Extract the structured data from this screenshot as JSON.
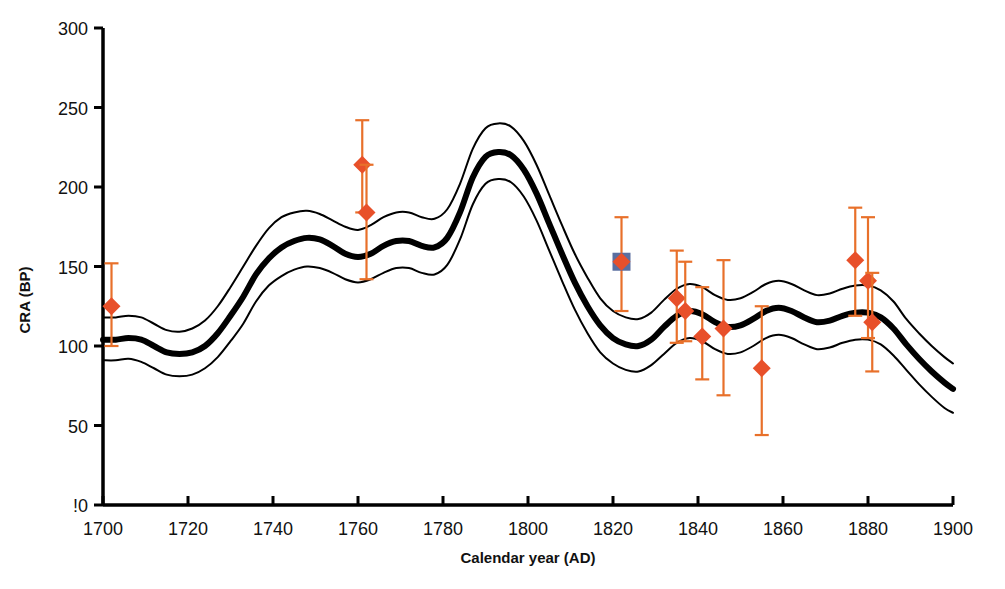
{
  "chart_data": {
    "type": "line",
    "title": "",
    "xlabel": "Calendar year (AD)",
    "ylabel": "CRA (BP)",
    "xlim": [
      1700,
      1900
    ],
    "ylim": [
      0,
      300
    ],
    "xticks": [
      1700,
      1720,
      1740,
      1760,
      1780,
      1800,
      1820,
      1840,
      1860,
      1880,
      1900
    ],
    "yticks": [
      0,
      50,
      100,
      150,
      200,
      250,
      300
    ],
    "ytick_labels": [
      "!0",
      "50",
      "100",
      "150",
      "200",
      "250",
      "300"
    ],
    "grid": false,
    "legend": false,
    "legend_position": "none",
    "series": [
      {
        "name": "calibration-curve-mean",
        "role": "mean",
        "style": "thick-black-line",
        "color": "#000000",
        "width_px": 6,
        "x": [
          1700,
          1703,
          1706,
          1709,
          1712,
          1715,
          1718,
          1721,
          1724,
          1727,
          1730,
          1733,
          1736,
          1739,
          1742,
          1745,
          1748,
          1751,
          1754,
          1757,
          1760,
          1763,
          1766,
          1769,
          1772,
          1775,
          1778,
          1781,
          1784,
          1787,
          1790,
          1793,
          1796,
          1799,
          1802,
          1805,
          1808,
          1811,
          1814,
          1817,
          1820,
          1823,
          1826,
          1829,
          1832,
          1835,
          1838,
          1841,
          1844,
          1847,
          1850,
          1853,
          1856,
          1859,
          1862,
          1865,
          1868,
          1871,
          1874,
          1877,
          1880,
          1883,
          1886,
          1889,
          1892,
          1895,
          1898,
          1900
        ],
        "y": [
          104,
          104,
          105,
          104,
          100,
          96,
          95,
          96,
          100,
          108,
          119,
          131,
          145,
          155,
          162,
          166,
          168,
          167,
          163,
          158,
          156,
          158,
          163,
          166,
          166,
          163,
          162,
          168,
          184,
          206,
          219,
          222,
          220,
          211,
          196,
          177,
          158,
          140,
          125,
          113,
          105,
          101,
          100,
          104,
          112,
          119,
          122,
          120,
          115,
          112,
          113,
          117,
          122,
          124,
          122,
          118,
          115,
          116,
          119,
          121,
          121,
          118,
          111,
          101,
          92,
          84,
          77,
          73
        ]
      },
      {
        "name": "calibration-curve-upper",
        "role": "upper-1sigma",
        "style": "thin-black-line",
        "color": "#000000",
        "width_px": 2,
        "x": [
          1700,
          1703,
          1706,
          1709,
          1712,
          1715,
          1718,
          1721,
          1724,
          1727,
          1730,
          1733,
          1736,
          1739,
          1742,
          1745,
          1748,
          1751,
          1754,
          1757,
          1760,
          1763,
          1766,
          1769,
          1772,
          1775,
          1778,
          1781,
          1784,
          1787,
          1790,
          1793,
          1796,
          1799,
          1802,
          1805,
          1808,
          1811,
          1814,
          1817,
          1820,
          1823,
          1826,
          1829,
          1832,
          1835,
          1838,
          1841,
          1844,
          1847,
          1850,
          1853,
          1856,
          1859,
          1862,
          1865,
          1868,
          1871,
          1874,
          1877,
          1880,
          1883,
          1886,
          1889,
          1892,
          1895,
          1898,
          1900
        ],
        "y": [
          118,
          118,
          119,
          118,
          114,
          110,
          109,
          111,
          116,
          125,
          137,
          150,
          163,
          174,
          181,
          184,
          185,
          183,
          179,
          175,
          173,
          176,
          181,
          184,
          184,
          181,
          180,
          186,
          202,
          224,
          237,
          240,
          238,
          229,
          214,
          195,
          176,
          158,
          143,
          130,
          122,
          118,
          117,
          121,
          129,
          136,
          139,
          137,
          132,
          129,
          130,
          134,
          139,
          141,
          139,
          135,
          132,
          133,
          136,
          138,
          138,
          135,
          128,
          117,
          108,
          100,
          93,
          89
        ]
      },
      {
        "name": "calibration-curve-lower",
        "role": "lower-1sigma",
        "style": "thin-black-line",
        "color": "#000000",
        "width_px": 2,
        "x": [
          1700,
          1703,
          1706,
          1709,
          1712,
          1715,
          1718,
          1721,
          1724,
          1727,
          1730,
          1733,
          1736,
          1739,
          1742,
          1745,
          1748,
          1751,
          1754,
          1757,
          1760,
          1763,
          1766,
          1769,
          1772,
          1775,
          1778,
          1781,
          1784,
          1787,
          1790,
          1793,
          1796,
          1799,
          1802,
          1805,
          1808,
          1811,
          1814,
          1817,
          1820,
          1823,
          1826,
          1829,
          1832,
          1835,
          1838,
          1841,
          1844,
          1847,
          1850,
          1853,
          1856,
          1859,
          1862,
          1865,
          1868,
          1871,
          1874,
          1877,
          1880,
          1883,
          1886,
          1889,
          1892,
          1895,
          1898,
          1900
        ],
        "y": [
          91,
          91,
          92,
          90,
          86,
          82,
          81,
          82,
          86,
          93,
          103,
          114,
          128,
          138,
          144,
          148,
          150,
          149,
          146,
          142,
          140,
          142,
          146,
          149,
          149,
          146,
          145,
          151,
          167,
          189,
          202,
          205,
          203,
          194,
          179,
          160,
          141,
          123,
          108,
          96,
          89,
          85,
          84,
          88,
          95,
          102,
          105,
          103,
          98,
          95,
          96,
          100,
          105,
          107,
          105,
          101,
          98,
          99,
          102,
          104,
          104,
          101,
          94,
          85,
          76,
          68,
          61,
          58
        ]
      }
    ],
    "points": {
      "name": "radiocarbon-measurements",
      "marker": "diamond",
      "color": "#E8502A",
      "errorbar_color": "#E8702A",
      "values": [
        {
          "x": 1702,
          "y": 125,
          "yerr_low": 100,
          "yerr_high": 152,
          "marker": "diamond",
          "has_square": false
        },
        {
          "x": 1761,
          "y": 214,
          "yerr_low": 184,
          "yerr_high": 242,
          "marker": "diamond",
          "has_square": false
        },
        {
          "x": 1762,
          "y": 184,
          "yerr_low": 142,
          "yerr_high": 214,
          "marker": "diamond",
          "has_square": false
        },
        {
          "x": 1822,
          "y": 153,
          "yerr_low": 122,
          "yerr_high": 181,
          "marker": "diamond",
          "has_square": true,
          "square_color": "#5A6FA0"
        },
        {
          "x": 1835,
          "y": 130,
          "yerr_low": 102,
          "yerr_high": 160,
          "marker": "diamond",
          "has_square": false
        },
        {
          "x": 1837,
          "y": 122,
          "yerr_low": 103,
          "yerr_high": 153,
          "marker": "diamond",
          "has_square": false
        },
        {
          "x": 1841,
          "y": 106,
          "yerr_low": 79,
          "yerr_high": 137,
          "marker": "diamond",
          "has_square": false
        },
        {
          "x": 1846,
          "y": 111,
          "yerr_low": 69,
          "yerr_high": 154,
          "marker": "diamond",
          "has_square": false
        },
        {
          "x": 1855,
          "y": 86,
          "yerr_low": 44,
          "yerr_high": 125,
          "marker": "diamond",
          "has_square": false
        },
        {
          "x": 1877,
          "y": 154,
          "yerr_low": 119,
          "yerr_high": 187,
          "marker": "diamond",
          "has_square": false
        },
        {
          "x": 1880,
          "y": 141,
          "yerr_low": 105,
          "yerr_high": 181,
          "marker": "diamond",
          "has_square": false
        },
        {
          "x": 1881,
          "y": 115,
          "yerr_low": 84,
          "yerr_high": 146,
          "marker": "diamond",
          "has_square": false
        }
      ]
    }
  }
}
